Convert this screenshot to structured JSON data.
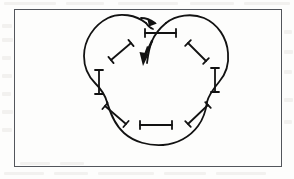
{
  "figure": {
    "kind": "line-diagram",
    "caption_text": "",
    "frame": {
      "x": 14,
      "y": 9,
      "width": 268,
      "height": 158,
      "border_color": "#53565c",
      "border_width_px": 1,
      "fill": "none"
    },
    "background_color": "#fdfdfc",
    "ink_color": "#121212",
    "stroke_width_px": 1.7,
    "curve": {
      "name": "three-lobed-closed-curve",
      "description": "closed trefoil-like curve with three convex lobes separated by three inward cusps",
      "lobes": 3,
      "cusps": 3,
      "closed": true,
      "path": "M 147,23 C 133,13 112,14 99,26 C 86,38 80,55 84,70 C 88,85 100,95 104,104 C 110,118 120,135 140,141 C 152,145 166,144 178,138 C 192,131 200,117 205,104 C 209,94 217,86 221,74 C 226,58 221,38 206,27 C 192,16 160,16 147,38 C 147,38 147,31 147,23 Z"
    },
    "arrows": [
      {
        "name": "top-right-arrowhead",
        "direction": "right",
        "tip_x": 153,
        "tip_y": 22,
        "angle_deg": 15,
        "size_px": 9
      },
      {
        "name": "center-down-arrow",
        "direction": "down",
        "tip_x": 143,
        "tip_y": 63,
        "tail_x": 151,
        "tail_y": 42,
        "angle_deg": 200,
        "size_px": 11,
        "style": "thick-filled"
      }
    ],
    "markers": [
      {
        "name": "marker-top-center",
        "shape": "dumbbell",
        "orientation": "horizontal",
        "x1": 145,
        "y1": 33,
        "x2": 176,
        "y2": 33,
        "crosses_curve": true
      },
      {
        "name": "marker-upper-left",
        "shape": "dumbbell",
        "orientation": "diagonal-up-right",
        "x1": 111,
        "y1": 60,
        "x2": 131,
        "y2": 43,
        "crosses_curve": false
      },
      {
        "name": "marker-upper-right",
        "shape": "dumbbell",
        "orientation": "diagonal-down-right",
        "x1": 188,
        "y1": 43,
        "x2": 206,
        "y2": 61,
        "crosses_curve": false
      },
      {
        "name": "marker-left-vertical",
        "shape": "dumbbell",
        "orientation": "vertical",
        "x1": 99,
        "y1": 70,
        "x2": 99,
        "y2": 94,
        "crosses_curve": true
      },
      {
        "name": "marker-right-vertical",
        "shape": "dumbbell",
        "orientation": "vertical",
        "x1": 215,
        "y1": 68,
        "x2": 215,
        "y2": 92,
        "crosses_curve": true
      },
      {
        "name": "marker-lower-left",
        "shape": "dumbbell",
        "orientation": "diagonal-down-right",
        "x1": 105,
        "y1": 106,
        "x2": 126,
        "y2": 124,
        "crosses_curve": true
      },
      {
        "name": "marker-lower-right",
        "shape": "dumbbell",
        "orientation": "diagonal-down-left",
        "x1": 208,
        "y1": 105,
        "x2": 188,
        "y2": 124,
        "crosses_curve": true
      },
      {
        "name": "marker-bottom-center",
        "shape": "dumbbell",
        "orientation": "horizontal",
        "x1": 140,
        "y1": 125,
        "x2": 172,
        "y2": 125,
        "crosses_curve": false
      }
    ],
    "marker_cap_length_px": 8,
    "marker_count": 8,
    "arrow_count": 2
  }
}
